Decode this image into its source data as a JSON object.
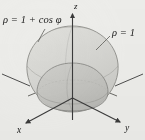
{
  "figure": {
    "background_color": "#efefec",
    "axes": {
      "z_label": "z",
      "x_label": "x",
      "y_label": "y",
      "axis_color": "#4a4a4a"
    },
    "labels": {
      "outer_surface": {
        "rho": "ρ",
        "equals": " = ",
        "expression": "1 + cos φ",
        "full": "ρ = 1 + cos φ"
      },
      "inner_surface": {
        "rho": "ρ",
        "equals": " = ",
        "expression": "1",
        "full": "ρ = 1"
      }
    },
    "surfaces": [
      {
        "name": "outer-cardioid-surface",
        "equation": "ρ = 1 + cos φ",
        "fill_color": "#d9d9d5",
        "stroke_color": "#8a8a86",
        "opacity": 0.85
      },
      {
        "name": "inner-unit-sphere",
        "equation": "ρ = 1",
        "fill_color": "#c6c6c2",
        "stroke_color": "#7d7d79",
        "opacity": 0.9
      }
    ]
  }
}
